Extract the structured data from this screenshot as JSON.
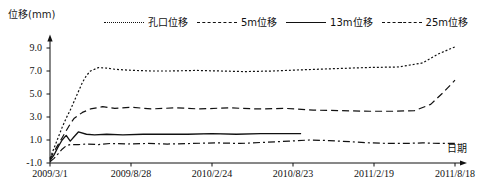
{
  "chart_data": {
    "type": "line",
    "title": "",
    "ylabel": "位移(mm)",
    "xlabel": "日期",
    "ylim": [
      -1.0,
      10.0
    ],
    "yticks": [
      -1.0,
      1.0,
      3.0,
      5.0,
      7.0,
      9.0
    ],
    "ytick_labels": [
      "-1.0",
      "1.0",
      "3.0",
      "5.0",
      "7.0",
      "9.0"
    ],
    "grid": false,
    "legend_position": "top",
    "xtick_labels": [
      "2009/3/1",
      "2009/8/28",
      "2010/2/24",
      "2010/8/23",
      "2011/2/19",
      "2011/8/18"
    ],
    "x_unit": "date",
    "series": [
      {
        "name": "孔口位移",
        "style": "dotted",
        "color": "#111111",
        "x": [
          0,
          1,
          2,
          3,
          4,
          5,
          6,
          7,
          8,
          9,
          10,
          12,
          14,
          16,
          18,
          21,
          25,
          30,
          36,
          42,
          48,
          55,
          62,
          70,
          78,
          86,
          92,
          96,
          100
        ],
        "values": [
          -0.6,
          0.3,
          1.2,
          2.1,
          2.9,
          3.6,
          4.4,
          5.2,
          6.0,
          6.6,
          7.0,
          7.3,
          7.25,
          7.15,
          7.1,
          7.05,
          7.0,
          7.0,
          7.05,
          7.0,
          6.95,
          7.0,
          7.1,
          7.2,
          7.3,
          7.35,
          7.7,
          8.5,
          9.1
        ]
      },
      {
        "name": "5m位移",
        "style": "dashed",
        "color": "#111111",
        "x": [
          0,
          1,
          2,
          3,
          4,
          5,
          6,
          8,
          10,
          13,
          16,
          20,
          25,
          31,
          37,
          44,
          51,
          58,
          65,
          72,
          79,
          85,
          90,
          94,
          97,
          100
        ],
        "values": [
          -0.7,
          0.0,
          0.6,
          1.2,
          1.8,
          2.4,
          2.9,
          3.4,
          3.7,
          3.9,
          3.75,
          3.85,
          3.7,
          3.8,
          3.7,
          3.8,
          3.7,
          3.75,
          3.6,
          3.55,
          3.5,
          3.5,
          3.55,
          4.1,
          5.1,
          6.2
        ]
      },
      {
        "name": "13m位移",
        "style": "solid",
        "color": "#111111",
        "x": [
          0,
          1,
          2,
          3,
          4,
          5,
          6,
          7,
          9,
          11,
          14,
          18,
          23,
          28,
          34,
          40,
          46,
          52,
          58,
          62
        ],
        "values": [
          -0.8,
          -0.3,
          0.4,
          1.0,
          1.4,
          0.9,
          1.3,
          1.7,
          1.5,
          1.45,
          1.5,
          1.45,
          1.5,
          1.5,
          1.5,
          1.55,
          1.5,
          1.55,
          1.55,
          1.55
        ]
      },
      {
        "name": "25m位移",
        "style": "dashdot",
        "color": "#111111",
        "x": [
          0,
          1,
          2,
          3,
          4,
          5,
          7,
          9,
          12,
          15,
          19,
          24,
          29,
          35,
          41,
          47,
          53,
          59,
          64,
          69,
          74,
          79,
          84,
          88,
          92,
          96,
          100
        ],
        "values": [
          -0.9,
          -0.6,
          -0.2,
          0.2,
          0.5,
          0.6,
          0.6,
          0.65,
          0.6,
          0.7,
          0.65,
          0.7,
          0.65,
          0.7,
          0.75,
          0.7,
          0.8,
          0.9,
          1.0,
          0.95,
          0.85,
          0.75,
          0.7,
          0.7,
          0.75,
          0.7,
          0.7
        ]
      }
    ]
  }
}
